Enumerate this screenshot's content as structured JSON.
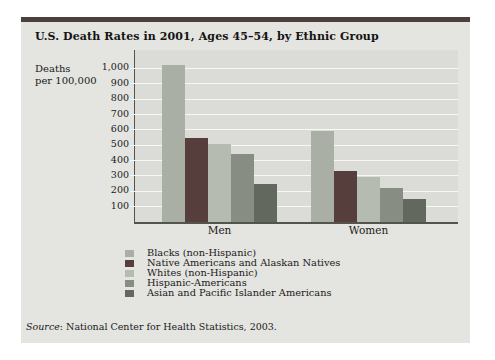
{
  "figure": {
    "title": "U.S. Death Rates in 2001, Ages 45–54, by Ethnic Group",
    "y_axis_label_line1": "Deaths",
    "y_axis_label_line2": "per 100,000",
    "source_label": "Source",
    "source_text": ": National Center for Health Statistics, 2003.",
    "colors": {
      "top_border": "#4b403b",
      "figure_bg": "#e4e4e0",
      "plot_bg": "#dbdcd7",
      "gridline": "#f7f7f4",
      "axis": "#54544f"
    }
  },
  "chart_data": {
    "type": "bar",
    "title": "U.S. Death Rates in 2001, Ages 45–54, by Ethnic Group",
    "xlabel": "",
    "ylabel": "Deaths per 100,000",
    "categories": [
      "Men",
      "Women"
    ],
    "series": [
      {
        "name": "Blacks (non-Hispanic)",
        "color": "#a9afa5",
        "values": [
          1020,
          595
        ]
      },
      {
        "name": "Native Americans and Alaskan Natives",
        "color": "#553e3c",
        "values": [
          545,
          330
        ]
      },
      {
        "name": "Whites (non-Hispanic)",
        "color": "#b6bbb2",
        "values": [
          505,
          295
        ]
      },
      {
        "name": "Hispanic-Americans",
        "color": "#888d84",
        "values": [
          445,
          220
        ]
      },
      {
        "name": "Asian and Pacific Islander Americans",
        "color": "#63685f",
        "values": [
          250,
          150
        ]
      }
    ],
    "ylim": [
      0,
      1120
    ],
    "yticks": [
      100,
      200,
      300,
      400,
      500,
      600,
      700,
      800,
      900,
      1000
    ],
    "ytick_labels": [
      "100",
      "200",
      "300",
      "400",
      "500",
      "600",
      "700",
      "800",
      "900",
      "1,000"
    ],
    "grid": true,
    "legend_position": "bottom",
    "source": "Source: National Center for Health Statistics, 2003."
  }
}
